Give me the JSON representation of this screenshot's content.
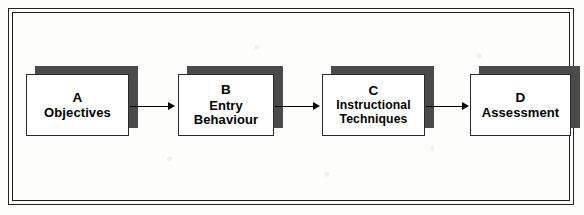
{
  "diagram": {
    "type": "flow-diagram",
    "orientation": "left-to-right",
    "frame": {
      "style": "double-line-rectangle",
      "color": "#1a1a1a"
    },
    "palette": {
      "box_fill": "#ffffff",
      "box_border": "#2a2a2a",
      "shadow": "#4a4a4a",
      "arrow": "#000000",
      "text": "#000000",
      "background": "#fdfdfc"
    },
    "nodes": [
      {
        "id": "A",
        "letter": "A",
        "lines": [
          "Objectives"
        ],
        "label": "Objectives"
      },
      {
        "id": "B",
        "letter": "B",
        "lines": [
          "Entry",
          "Behaviour"
        ],
        "label": "Entry Behaviour"
      },
      {
        "id": "C",
        "letter": "C",
        "lines": [
          "Instructional",
          "Techniques"
        ],
        "label": "Instructional Techniques"
      },
      {
        "id": "D",
        "letter": "D",
        "lines": [
          "Assessment"
        ],
        "label": "Assessment"
      }
    ],
    "connectors": [
      {
        "id": "ab",
        "from": "A",
        "to": "B",
        "style": "solid-arrow"
      },
      {
        "id": "bc",
        "from": "B",
        "to": "C",
        "style": "solid-arrow"
      },
      {
        "id": "cd",
        "from": "C",
        "to": "D",
        "style": "solid-arrow"
      }
    ]
  }
}
